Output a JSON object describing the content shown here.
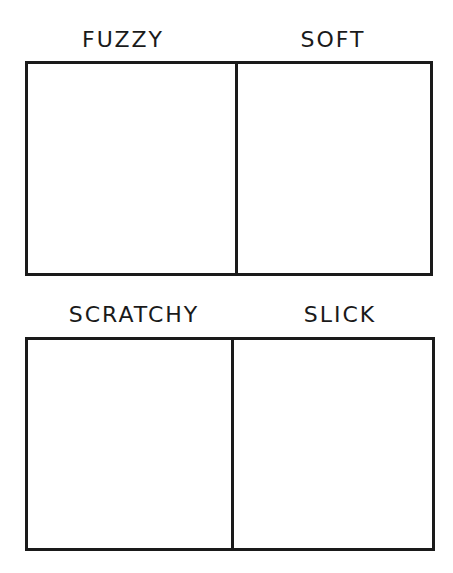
{
  "worksheet": {
    "rows": [
      {
        "panels": [
          {
            "label": "FUZZY"
          },
          {
            "label": "SOFT"
          }
        ]
      },
      {
        "panels": [
          {
            "label": "SCRATCHY"
          },
          {
            "label": "SLICK"
          }
        ]
      }
    ]
  },
  "colors": {
    "line": "#1a1a1a",
    "background": "#ffffff"
  }
}
